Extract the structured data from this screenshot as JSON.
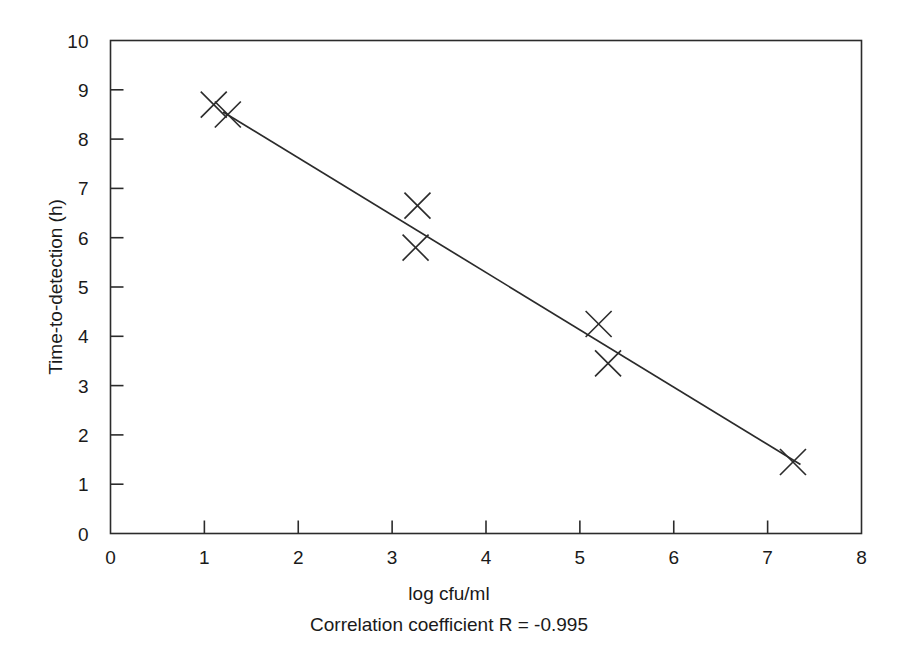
{
  "chart_data": {
    "type": "scatter",
    "title": "",
    "xlabel": "log cfu/ml",
    "ylabel": "Time-to-detection (h)",
    "xlim": [
      0,
      8
    ],
    "ylim": [
      0,
      10
    ],
    "xticks": [
      0,
      1,
      2,
      3,
      4,
      5,
      6,
      7,
      8
    ],
    "xtick_labels": [
      "0",
      "1",
      "2",
      "3",
      "4",
      "5",
      "6",
      "7",
      "8"
    ],
    "yticks": [
      0,
      1,
      2,
      3,
      4,
      5,
      6,
      7,
      8,
      9,
      10
    ],
    "ytick_labels": [
      "0",
      "1",
      "2",
      "3",
      "4",
      "5",
      "6",
      "7",
      "8",
      "9",
      "10"
    ],
    "grid": false,
    "legend": "none",
    "marker": "x-cross",
    "points": [
      {
        "x": 1.1,
        "y": 8.7
      },
      {
        "x": 1.25,
        "y": 8.5
      },
      {
        "x": 3.27,
        "y": 6.65
      },
      {
        "x": 3.25,
        "y": 5.8
      },
      {
        "x": 5.2,
        "y": 4.25
      },
      {
        "x": 5.3,
        "y": 3.45
      },
      {
        "x": 7.27,
        "y": 1.45
      }
    ],
    "fit_line": {
      "name": "linear regression fit",
      "x_start": 1.2,
      "y_start": 8.55,
      "x_end": 7.35,
      "y_end": 1.4
    },
    "annotations": [
      {
        "name": "correlation-note",
        "text": "Correlation coefficient R = -0.995"
      }
    ]
  },
  "axis": {
    "x_title": "log cfu/ml",
    "y_title": "Time-to-detection (h)"
  },
  "caption": {
    "correlation": "Correlation coefficient R = -0.995"
  },
  "colors": {
    "ink": "#2b2b2b",
    "background": "#ffffff"
  }
}
